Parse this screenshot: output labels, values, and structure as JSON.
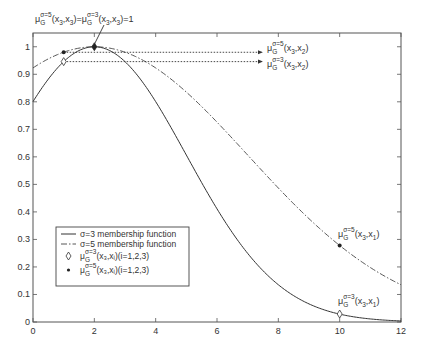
{
  "chart_data": {
    "type": "line",
    "title": "",
    "xlabel": "",
    "ylabel": "",
    "xlim": [
      0,
      12
    ],
    "ylim": [
      0,
      1.05
    ],
    "grid": false,
    "legend_position": "lower-left inside",
    "x_ticks": [
      "0",
      "2",
      "4",
      "6",
      "8",
      "10",
      "12"
    ],
    "y_ticks": [
      "0",
      "0.1",
      "0.2",
      "0.3",
      "0.4",
      "0.5",
      "0.6",
      "0.7",
      "0.8",
      "0.9",
      "1"
    ],
    "series": [
      {
        "name": "σ=3 membership function",
        "style": "solid",
        "function": "exp(-(x-2)^2/(2*3^2))",
        "x": [
          0,
          1,
          2,
          3,
          4,
          5,
          6,
          7,
          8,
          9,
          10,
          11,
          12
        ],
        "values": [
          0.8,
          0.946,
          1.0,
          0.946,
          0.8,
          0.607,
          0.411,
          0.249,
          0.135,
          0.066,
          0.029,
          0.011,
          0.004
        ]
      },
      {
        "name": "σ=5 membership function",
        "style": "dash-dot",
        "function": "exp(-(x-2)^2/(2*5^2))",
        "x": [
          0,
          1,
          2,
          3,
          4,
          5,
          6,
          7,
          8,
          9,
          10,
          11,
          12
        ],
        "values": [
          0.923,
          0.98,
          1.0,
          0.98,
          0.923,
          0.835,
          0.726,
          0.607,
          0.487,
          0.375,
          0.278,
          0.198,
          0.135
        ]
      },
      {
        "name": "μG σ=3 (x3,xi)(i=1,2,3)",
        "style": "diamond-marker",
        "x": [
          1,
          2,
          10
        ],
        "values": [
          0.946,
          1.0,
          0.029
        ]
      },
      {
        "name": "μG σ=5 (x3,xi)(i=1,2,3)",
        "style": "dot-marker",
        "x": [
          1,
          2,
          10
        ],
        "values": [
          0.98,
          1.0,
          0.278
        ]
      }
    ],
    "annotations": [
      {
        "text": "μG σ=5 (x3,x3)=μG σ=3 (x3,x3)=1",
        "points_to": [
          2,
          1.0
        ]
      },
      {
        "text": "μG σ=5 (x3,x2)",
        "arrow_from": [
          1,
          0.98
        ],
        "position": "right"
      },
      {
        "text": "μG σ=3 (x3,x2)",
        "arrow_from": [
          1,
          0.946
        ],
        "position": "right"
      },
      {
        "text": "μG σ=5 (x3,x1)",
        "near": [
          10,
          0.278
        ]
      },
      {
        "text": "μG σ=3 (x3,x1)",
        "near": [
          10,
          0.029
        ]
      }
    ]
  },
  "legend": {
    "items": [
      {
        "label": "σ=3 membership function",
        "marker": "solid-line"
      },
      {
        "label": "σ=5 membership function",
        "marker": "dash-dot-line"
      },
      {
        "label": "(x₃,xᵢ)(i=1,2,3)",
        "mu": "μ",
        "sub": "G",
        "sup": "σ=3",
        "marker": "diamond"
      },
      {
        "label": "(x₃,xᵢ)(i=1,2,3)",
        "mu": "μ",
        "sub": "G",
        "sup": "σ=5",
        "marker": "dot"
      }
    ]
  },
  "annotations": {
    "top": {
      "mu": "μ",
      "sub": "G",
      "sup1": "σ=5",
      "args1": "(x",
      "s1": "3",
      "c1": ",x",
      "s2": "3",
      "end1": ")=",
      "mu2": "μ",
      "sup2": "σ=3",
      "args2": "(x",
      "s3": "3",
      "c2": ",x",
      "s4": "3",
      "end2": ")=1"
    },
    "s5x2": {
      "mu": "μ",
      "sub": "G",
      "sup": "σ=5",
      "a": "(x",
      "s1": "3",
      "b": ",x",
      "s2": "2",
      "c": ")"
    },
    "s3x2": {
      "mu": "μ",
      "sub": "G",
      "sup": "σ=3",
      "a": "(x",
      "s1": "3",
      "b": ",x",
      "s2": "2",
      "c": ")"
    },
    "s5x1": {
      "mu": "μ",
      "sub": "G",
      "sup": "σ=5",
      "a": "(x",
      "s1": "3",
      "b": ",x",
      "s2": "1",
      "c": ")"
    },
    "s3x1": {
      "mu": "μ",
      "sub": "G",
      "sup": "σ=3",
      "a": "(x",
      "s1": "3",
      "b": ",x",
      "s2": "1",
      "c": ")"
    }
  },
  "colors": {
    "axis": "#555555",
    "curve": "#333333",
    "background": "#ffffff"
  }
}
